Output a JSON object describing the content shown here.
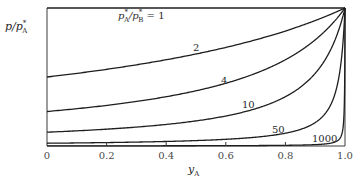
{
  "chart_data": {
    "type": "line",
    "title": "",
    "xlabel": "y_A",
    "ylabel": "p/p*_A",
    "xlim": [
      0,
      1.0
    ],
    "ylim": [
      0,
      1.0
    ],
    "grid": false,
    "legend": "none (curves labeled inline)",
    "x_ticks": [
      0,
      0.2,
      0.4,
      0.6,
      0.8,
      1.0
    ],
    "x_tick_labels": [
      "0",
      "0.2",
      "0.4",
      "0.6",
      "0.8",
      "1.0"
    ],
    "y_ticks": [],
    "formula": "p/p*_A = 1 / (alpha - (alpha - 1) * y_A), alpha = p*_A/p*_B",
    "x": [
      0,
      0.1,
      0.2,
      0.3,
      0.4,
      0.5,
      0.6,
      0.7,
      0.8,
      0.9,
      0.95,
      0.99,
      1.0
    ],
    "series": [
      {
        "name": "p*_A/p*_B = 1",
        "alpha": 1,
        "values": [
          1,
          1,
          1,
          1,
          1,
          1,
          1,
          1,
          1,
          1,
          1,
          1,
          1
        ]
      },
      {
        "name": "2",
        "alpha": 2,
        "values": [
          0.5,
          0.526,
          0.556,
          0.588,
          0.625,
          0.667,
          0.714,
          0.769,
          0.833,
          0.909,
          0.952,
          0.99,
          1.0
        ]
      },
      {
        "name": "4",
        "alpha": 4,
        "values": [
          0.25,
          0.27,
          0.294,
          0.323,
          0.357,
          0.4,
          0.455,
          0.526,
          0.625,
          0.769,
          0.87,
          0.971,
          1.0
        ]
      },
      {
        "name": "10",
        "alpha": 10,
        "values": [
          0.1,
          0.11,
          0.122,
          0.137,
          0.156,
          0.182,
          0.217,
          0.27,
          0.357,
          0.526,
          0.69,
          0.917,
          1.0
        ]
      },
      {
        "name": "50",
        "alpha": 50,
        "values": [
          0.02,
          0.022,
          0.025,
          0.028,
          0.033,
          0.039,
          0.049,
          0.064,
          0.093,
          0.168,
          0.288,
          0.671,
          1.0
        ]
      },
      {
        "name": "1000",
        "alpha": 1000,
        "values": [
          0.001,
          0.0011,
          0.00125,
          0.00143,
          0.00166,
          0.002,
          0.0025,
          0.0033,
          0.005,
          0.0099,
          0.0196,
          0.091,
          1.0
        ]
      }
    ],
    "annotations": [
      {
        "text": "p*_A/p*_B = 1",
        "x": 0.24,
        "y": 0.95
      },
      {
        "text": "2",
        "x": 0.5,
        "y": 0.72
      },
      {
        "text": "4",
        "x": 0.59,
        "y": 0.48
      },
      {
        "text": "10",
        "x": 0.675,
        "y": 0.3
      },
      {
        "text": "50",
        "x": 0.775,
        "y": 0.12
      },
      {
        "text": "1000",
        "x": 0.915,
        "y": 0.06
      }
    ]
  },
  "labels": {
    "ylabel_main": "p/p",
    "ylabel_star": "*",
    "ylabel_sub": "A",
    "xlabel_main": "y",
    "xlabel_sub": "A",
    "alpha1_label_p1": "p",
    "alpha1_label_s1": "*",
    "alpha1_label_sub1": "A",
    "alpha1_label_p2": "/p",
    "alpha1_label_s2": "*",
    "alpha1_label_sub2": "B",
    "alpha1_label_eq": " = 1",
    "curve_2": "2",
    "curve_4": "4",
    "curve_10": "10",
    "curve_50": "50",
    "curve_1000": "1000"
  }
}
